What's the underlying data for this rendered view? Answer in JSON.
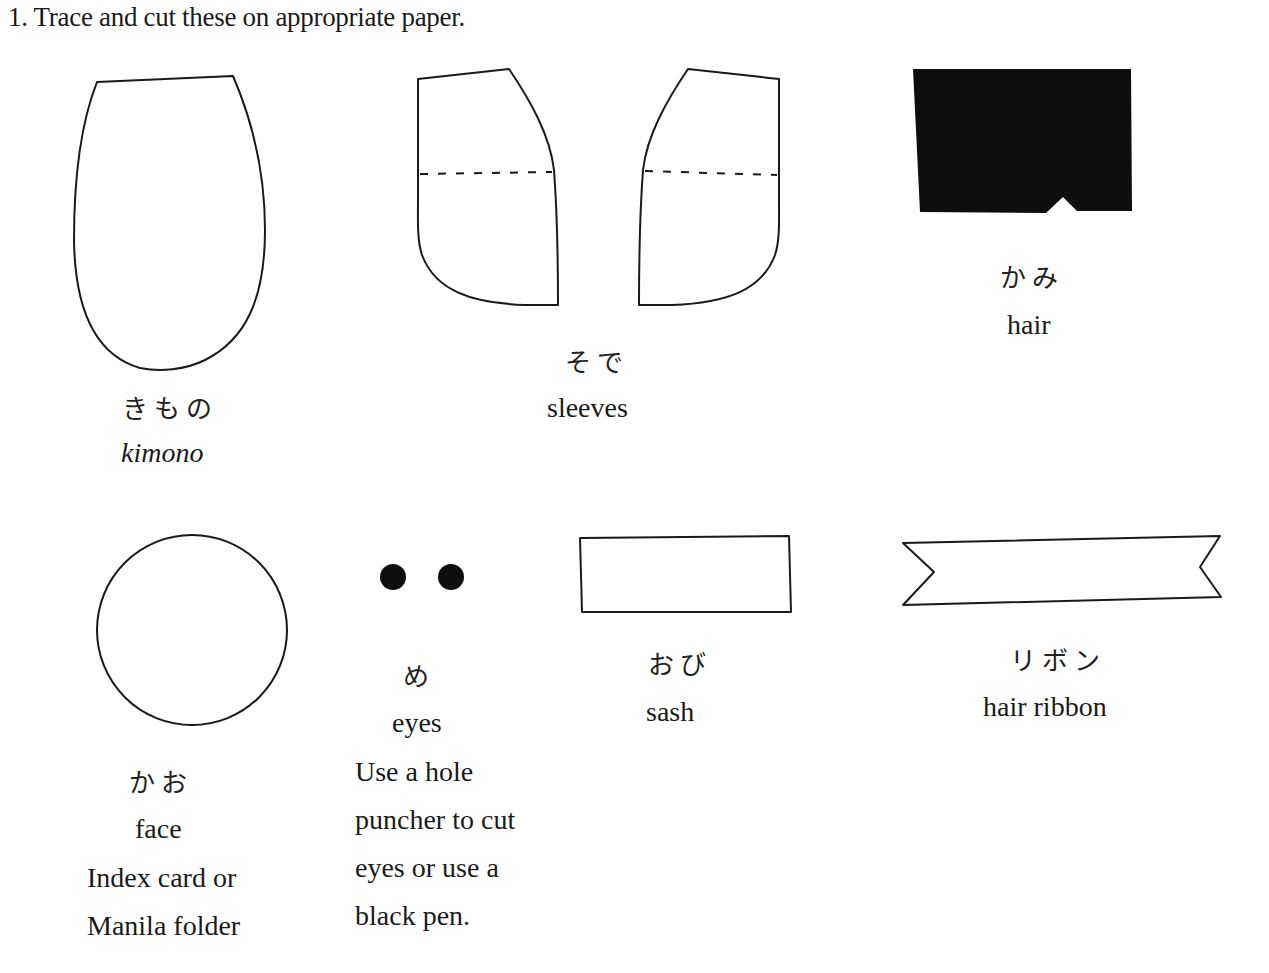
{
  "instruction": "1. Trace and cut these on appropriate paper.",
  "pieces": {
    "kimono": {
      "japanese": "きもの",
      "english": "kimono"
    },
    "sleeves": {
      "japanese": "そで",
      "english": "sleeves"
    },
    "hair": {
      "japanese": "かみ",
      "english": "hair"
    },
    "face": {
      "japanese": "かお",
      "english": "face",
      "note_lines": [
        "Index card or",
        "Manila folder"
      ]
    },
    "eyes": {
      "japanese": "め",
      "english": "eyes",
      "note_lines": [
        "Use a hole",
        "puncher to cut",
        "eyes or use a",
        "black pen."
      ]
    },
    "sash": {
      "japanese": "おび",
      "english": "sash"
    },
    "ribbon": {
      "japanese": "リボン",
      "english": "hair ribbon"
    }
  },
  "colors": {
    "ink": "#1a1a1a",
    "paper": "#ffffff"
  }
}
